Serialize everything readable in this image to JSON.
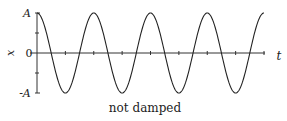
{
  "chart_data": {
    "type": "line",
    "title": "not damped",
    "xlabel": "t",
    "ylabel": "x",
    "y_ticks": [
      "A",
      "0",
      "-A"
    ],
    "function": "x(t) = A cos(omega t)",
    "amplitude_label": "A",
    "periods_shown": 4,
    "x_minor_ticks": 8,
    "grid": false,
    "legend": null,
    "series": [
      {
        "name": "x(t)",
        "shape": "cosine",
        "start": "A",
        "peaks_at_ticks": [
          0,
          2,
          4,
          6,
          8
        ]
      }
    ]
  },
  "labels": {
    "caption": "not damped",
    "x_axis": "t",
    "y_axis": "x",
    "y_top": "A",
    "y_zero": "0",
    "y_bottom": "-A"
  },
  "colors": {
    "line": "#222222",
    "axis": "#333333",
    "background": "#ffffff"
  }
}
